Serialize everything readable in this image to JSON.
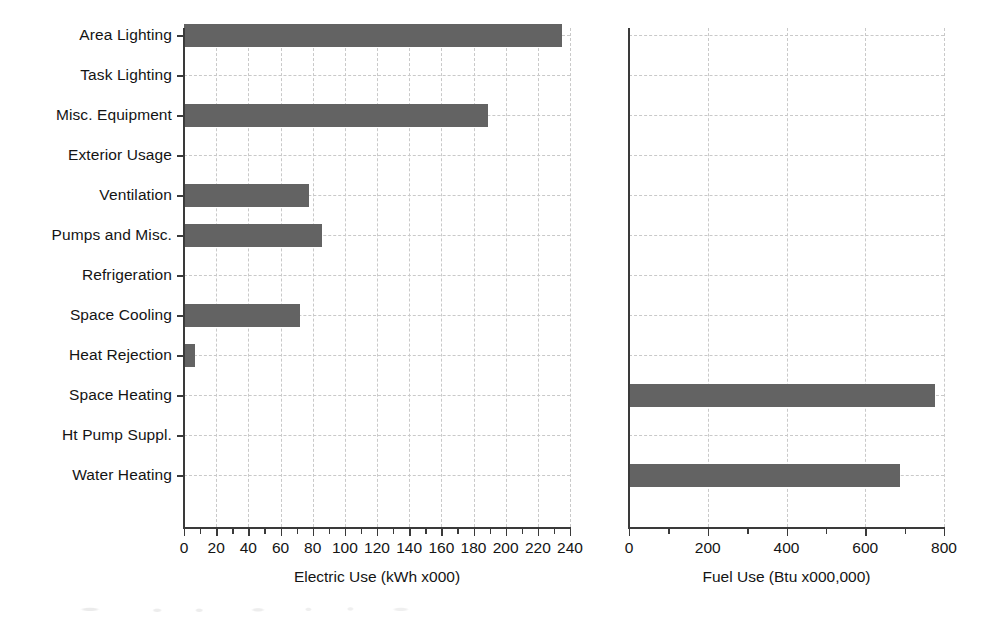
{
  "figure": {
    "background": "#ffffff",
    "bar_color": "#636363",
    "axis_color": "#3a3a3a",
    "grid_color": "#c9c9c9"
  },
  "categories_label": "End Use",
  "chart_data": [
    {
      "type": "bar",
      "orientation": "horizontal",
      "title": "",
      "xlabel": "Electric Use (kWh x000)",
      "ylabel": "",
      "xlim": [
        0,
        240
      ],
      "xticks": [
        0,
        20,
        40,
        60,
        80,
        100,
        120,
        140,
        160,
        180,
        200,
        220,
        240
      ],
      "xticklabels": [
        "0",
        "20",
        "40",
        "60",
        "80",
        "100",
        "120",
        "140",
        "160",
        "180",
        "200",
        "220",
        "240"
      ],
      "minor_tick_step": 10,
      "grid": true,
      "legend": "none",
      "categories": [
        "Area Lighting",
        "Task Lighting",
        "Misc. Equipment",
        "Exterior Usage",
        "Ventilation",
        "Pumps and Misc.",
        "Refrigeration",
        "Space Cooling",
        "Heat Rejection",
        "Space Heating",
        "Ht Pump Suppl.",
        "Water Heating"
      ],
      "values": [
        235,
        0,
        189,
        0,
        78,
        86,
        0,
        72,
        7,
        0,
        0,
        0
      ]
    },
    {
      "type": "bar",
      "orientation": "horizontal",
      "title": "",
      "xlabel": "Fuel Use (Btu x000,000)",
      "ylabel": "",
      "xlim": [
        0,
        800
      ],
      "xticks": [
        0,
        200,
        400,
        600,
        800
      ],
      "xticklabels": [
        "0",
        "200",
        "400",
        "600",
        "800"
      ],
      "minor_tick_step": 100,
      "grid": true,
      "legend": "none",
      "categories": [
        "Area Lighting",
        "Task Lighting",
        "Misc. Equipment",
        "Exterior Usage",
        "Ventilation",
        "Pumps and Misc.",
        "Refrigeration",
        "Space Cooling",
        "Heat Rejection",
        "Space Heating",
        "Ht Pump Suppl.",
        "Water Heating"
      ],
      "values": [
        0,
        0,
        0,
        0,
        0,
        0,
        0,
        0,
        0,
        777,
        0,
        688
      ]
    }
  ]
}
